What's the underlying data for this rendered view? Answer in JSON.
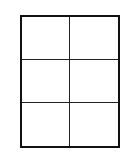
{
  "diagram": {
    "type": "grid",
    "columns": 2,
    "rows": 3,
    "cells": [
      {
        "row": 0,
        "col": 0,
        "text": ""
      },
      {
        "row": 0,
        "col": 1,
        "text": ""
      },
      {
        "row": 1,
        "col": 0,
        "text": ""
      },
      {
        "row": 1,
        "col": 1,
        "text": ""
      },
      {
        "row": 2,
        "col": 0,
        "text": ""
      },
      {
        "row": 2,
        "col": 1,
        "text": ""
      }
    ],
    "colors": {
      "border": "#111111",
      "divider": "#222222",
      "background": "#ffffff"
    }
  }
}
